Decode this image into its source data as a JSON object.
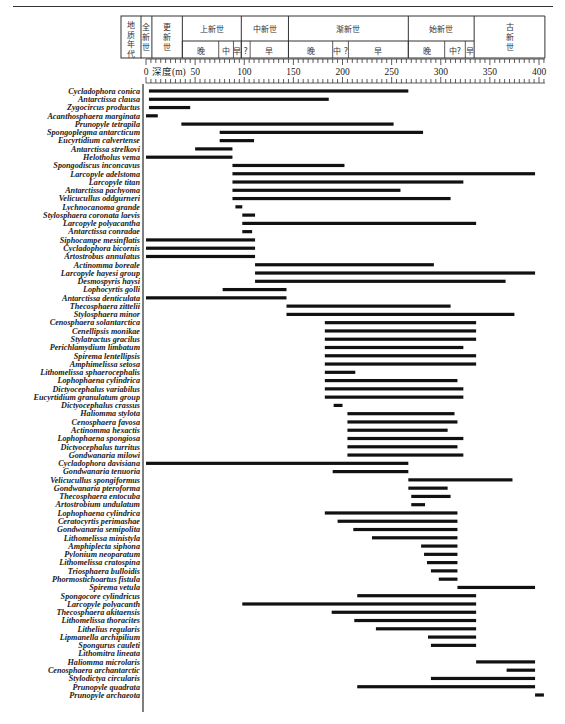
{
  "chart_data": {
    "type": "range",
    "title": "",
    "xlabel": "深度(m)",
    "xlim": [
      0,
      400
    ],
    "xticks": [
      0,
      50,
      100,
      150,
      200,
      250,
      300,
      350,
      400
    ],
    "minor_tick_step": 5,
    "header": {
      "era_label": "地质年代",
      "epochs": [
        {
          "name": "全新世",
          "from": -5,
          "to": 6,
          "vertical": true
        },
        {
          "name": "更新世",
          "from": 6,
          "to": 37,
          "vertical": true
        },
        {
          "name": "上新世",
          "from": 37,
          "to": 97
        },
        {
          "name": "中新世",
          "from": 97,
          "to": 145
        },
        {
          "name": "渐新世",
          "from": 145,
          "to": 267
        },
        {
          "name": "始新世",
          "from": 267,
          "to": 334
        },
        {
          "name": "古新世",
          "from": 334,
          "to": 406,
          "vertical": true
        }
      ],
      "stages": [
        {
          "name": "晚",
          "from": 37,
          "to": 74
        },
        {
          "name": "中",
          "from": 74,
          "to": 89
        },
        {
          "name": "早",
          "from": 89,
          "to": 97
        },
        {
          "name": "?",
          "from": 97,
          "to": 106
        },
        {
          "name": "早",
          "from": 106,
          "to": 145
        },
        {
          "name": "晚",
          "from": 145,
          "to": 190
        },
        {
          "name": "中 ?",
          "from": 190,
          "to": 206
        },
        {
          "name": "早",
          "from": 206,
          "to": 267
        },
        {
          "name": "晚",
          "from": 267,
          "to": 304
        },
        {
          "name": "中?",
          "from": 304,
          "to": 325
        },
        {
          "name": "早",
          "from": 325,
          "to": 334
        }
      ]
    },
    "series": [
      {
        "name": "Cycladophora conica",
        "start": 3,
        "end": 267
      },
      {
        "name": "Antarctissa clausa",
        "start": 3,
        "end": 186
      },
      {
        "name": "Zygocircus productus",
        "start": 3,
        "end": 45
      },
      {
        "name": "Acanthosphaera marginata",
        "start": 0,
        "end": 12
      },
      {
        "name": "Prunopyle tetrapila",
        "start": 36,
        "end": 252
      },
      {
        "name": "Spongoplegma antarcticum",
        "start": 75,
        "end": 282
      },
      {
        "name": "Eucyrtidium calvertense",
        "start": 75,
        "end": 110
      },
      {
        "name": "Antarctissa strelkovi",
        "start": 50,
        "end": 88
      },
      {
        "name": "Helotholus vema",
        "start": 0,
        "end": 88
      },
      {
        "name": "Spongodiscus inconcavus",
        "start": 88,
        "end": 202
      },
      {
        "name": "Larcopyle adelstoma",
        "start": 88,
        "end": 396
      },
      {
        "name": "Larcopyle titan",
        "start": 88,
        "end": 323
      },
      {
        "name": "Antarctissa pachyoma",
        "start": 88,
        "end": 259
      },
      {
        "name": "Velicucullus oddgurneri",
        "start": 88,
        "end": 310
      },
      {
        "name": "Lychnocanoma grande",
        "start": 91,
        "end": 98
      },
      {
        "name": "Stylosphaera coronata laevis",
        "start": 98,
        "end": 111
      },
      {
        "name": "Larcopyle polyacantha",
        "start": 98,
        "end": 336
      },
      {
        "name": "Antarctissa conradae",
        "start": 98,
        "end": 108
      },
      {
        "name": "Siphocampe mesinflatis",
        "start": 0,
        "end": 111
      },
      {
        "name": "Cycladophora bicornis",
        "start": 0,
        "end": 111
      },
      {
        "name": "Artostrobus annulatus",
        "start": 0,
        "end": 111
      },
      {
        "name": "Actinomma boreale",
        "start": 111,
        "end": 293
      },
      {
        "name": "Larcopyle hayesi group",
        "start": 111,
        "end": 396
      },
      {
        "name": "Desmospyris haysi",
        "start": 111,
        "end": 366
      },
      {
        "name": "Lophocyrtis golli",
        "start": 78,
        "end": 143
      },
      {
        "name": "Antarctissa denticulata",
        "start": 0,
        "end": 143
      },
      {
        "name": "Thecosphaera zittelii",
        "start": 143,
        "end": 310
      },
      {
        "name": "Stylosphaera minor",
        "start": 143,
        "end": 375
      },
      {
        "name": "Cenosphaera solantarctica",
        "start": 182,
        "end": 336
      },
      {
        "name": "Cenellipsis monikae",
        "start": 182,
        "end": 336
      },
      {
        "name": "Stylatractus gracilus",
        "start": 182,
        "end": 336
      },
      {
        "name": "Perichlamydium limbatum",
        "start": 182,
        "end": 323
      },
      {
        "name": "Spirema lentellipsis",
        "start": 182,
        "end": 336
      },
      {
        "name": "Amphimelissa setosa",
        "start": 182,
        "end": 336
      },
      {
        "name": "Lithomelissa sphaerocephalis",
        "start": 182,
        "end": 213
      },
      {
        "name": "Lophophaena cylindrica",
        "start": 182,
        "end": 317
      },
      {
        "name": "Dictyocephalus variabilus",
        "start": 182,
        "end": 323
      },
      {
        "name": "Eucyrtidium granulatum group",
        "start": 182,
        "end": 323
      },
      {
        "name": "Dictyocephalus crassus",
        "start": 191,
        "end": 200
      },
      {
        "name": "Haliomma stylota",
        "start": 205,
        "end": 314
      },
      {
        "name": "Cenosphaera favosa",
        "start": 205,
        "end": 317
      },
      {
        "name": "Actinomma hexactis",
        "start": 205,
        "end": 307
      },
      {
        "name": "Lophophaena spongiosa",
        "start": 205,
        "end": 323
      },
      {
        "name": "Dictyocephalus turritus",
        "start": 205,
        "end": 317
      },
      {
        "name": "Gondwanaria milowi",
        "start": 205,
        "end": 323
      },
      {
        "name": "Cycladophora davisiana",
        "start": 0,
        "end": 267
      },
      {
        "name": "Gondwanaria tenuoria",
        "start": 190,
        "end": 267
      },
      {
        "name": "Velicucullus spongiformus",
        "start": 267,
        "end": 373
      },
      {
        "name": "Gondwanaria pteroforma",
        "start": 267,
        "end": 307
      },
      {
        "name": "Thecosphaera entocuba",
        "start": 270,
        "end": 310
      },
      {
        "name": "Artostrobium undulatum",
        "start": 270,
        "end": 284
      },
      {
        "name": "Lophophaena cylindrica",
        "start": 182,
        "end": 317
      },
      {
        "name": "Ceratocyrtis perimashae",
        "start": 195,
        "end": 317
      },
      {
        "name": "Gondwanaria semipolita",
        "start": 211,
        "end": 317
      },
      {
        "name": "Lithomelissa ministyla",
        "start": 230,
        "end": 317
      },
      {
        "name": "Amphiplecta siphona",
        "start": 280,
        "end": 317
      },
      {
        "name": "Pylonium neoparatum",
        "start": 283,
        "end": 317
      },
      {
        "name": "Lithomelissa cratospina",
        "start": 286,
        "end": 317
      },
      {
        "name": "Triosphaera bulloidis",
        "start": 290,
        "end": 317
      },
      {
        "name": "Phormostichoartus fistula",
        "start": 298,
        "end": 317
      },
      {
        "name": "Spirema vetula",
        "start": 317,
        "end": 396
      },
      {
        "name": "Spongocore cylindricus",
        "start": 215,
        "end": 336
      },
      {
        "name": "Larcopyle polyacanth",
        "start": 98,
        "end": 336
      },
      {
        "name": "Thecosphaera akitaensis",
        "start": 189,
        "end": 336
      },
      {
        "name": "Lithomelissa thoracites",
        "start": 212,
        "end": 336
      },
      {
        "name": "Lithelius regularis",
        "start": 234,
        "end": 336
      },
      {
        "name": "Lipmanella archipilium",
        "start": 287,
        "end": 336
      },
      {
        "name": "Spongurus cauleti",
        "start": 290,
        "end": 336
      },
      {
        "name": "Lithomitra lineata",
        "start": null,
        "end": null
      },
      {
        "name": "Haliomma microlaris",
        "start": 336,
        "end": 396
      },
      {
        "name": "Cenosphaera archantarctic",
        "start": 367,
        "end": 396
      },
      {
        "name": "Stylodictya circularis",
        "start": 290,
        "end": 396
      },
      {
        "name": "Prunopyle quadrata",
        "start": 215,
        "end": 396
      },
      {
        "name": "Prunopyle archaeota",
        "start": 396,
        "end": 405
      }
    ]
  }
}
